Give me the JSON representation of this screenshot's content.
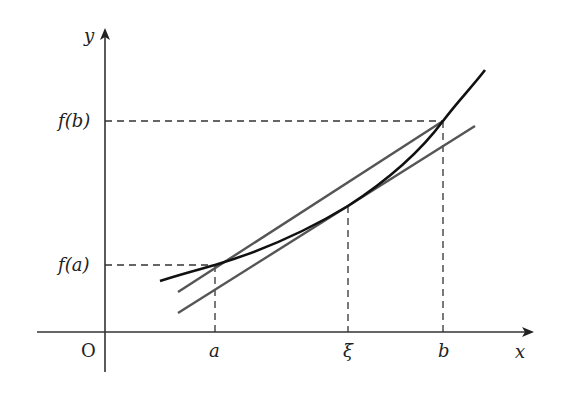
{
  "diagram": {
    "axes": {
      "x_label": "x",
      "y_label": "y",
      "origin_label": "O"
    },
    "points": {
      "a_label": "a",
      "xi_label": "ξ",
      "b_label": "b",
      "fa_label": "f(a)",
      "fb_label": "f(b)"
    },
    "colors": {
      "axis": "#333333",
      "curve": "#111111",
      "secant": "#555555",
      "tangent": "#555555",
      "dashed": "#333333"
    }
  }
}
